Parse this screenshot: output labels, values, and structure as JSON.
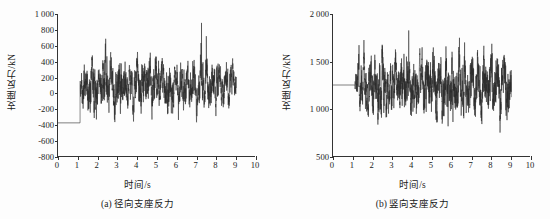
{
  "figure": {
    "background_color": "#fdfdfd",
    "trace_color": "#2b2b2b",
    "axis_color": "#333333"
  },
  "panels": [
    {
      "id": "panel-a",
      "caption": "(a) 径向支座反力",
      "xlabel": "时间/s",
      "ylabel": "支座反力/kN",
      "xticks": [
        "0",
        "1",
        "2",
        "3",
        "4",
        "5",
        "6",
        "7",
        "8",
        "9",
        "10"
      ],
      "yticks": [
        "1 000",
        "800",
        "600",
        "400",
        "200",
        "0",
        "-200",
        "-400",
        "-600",
        "-800"
      ]
    },
    {
      "id": "panel-b",
      "caption": "(b) 竖向支座反力",
      "xlabel": "时间/s",
      "ylabel": "支座反力/kN",
      "xticks": [
        "0",
        "1",
        "2",
        "3",
        "4",
        "5",
        "6",
        "7",
        "8",
        "9",
        "10"
      ],
      "yticks": [
        "2 000",
        "1 500",
        "1 000",
        "500"
      ]
    }
  ],
  "chart_data": [
    {
      "type": "line",
      "id": "panel-a",
      "title": "(a) 径向支座反力",
      "xlabel": "时间/s",
      "ylabel": "支座反力/kN",
      "xlim": [
        0,
        10
      ],
      "ylim": [
        -800,
        1000
      ],
      "xticks": [
        0,
        1,
        2,
        3,
        4,
        5,
        6,
        7,
        8,
        9,
        10
      ],
      "yticks": [
        -800,
        -600,
        -400,
        -200,
        0,
        200,
        400,
        600,
        800,
        1000
      ],
      "grid": false,
      "legend": null,
      "series": [
        {
          "name": "径向支座反力",
          "description": "Static baseline at approximately -380 kN from t=0 to t=1.12 s, then a dense high-frequency random vibration record from t=1.12 s to t=9.05 s oscillating about a mean of roughly +100 kN, with peaks reaching about 920 kN and troughs down to about -720 kN.",
          "baseline_value": -380,
          "baseline_end_time": 1.12,
          "record_start_time": 1.12,
          "record_end_time": 9.05,
          "mean_after_start": 100,
          "max_value": 920,
          "min_value": -720,
          "sample_rate_hz": 200,
          "seed": 20317,
          "envelope_points": [
            {
              "t": 1.12,
              "hi": 200,
              "lo": -300
            },
            {
              "t": 1.25,
              "hi": 660,
              "lo": -320
            },
            {
              "t": 1.55,
              "hi": 520,
              "lo": -420
            },
            {
              "t": 1.85,
              "hi": 540,
              "lo": -720
            },
            {
              "t": 2.15,
              "hi": 600,
              "lo": -450
            },
            {
              "t": 2.42,
              "hi": 920,
              "lo": -400
            },
            {
              "t": 2.7,
              "hi": 600,
              "lo": -430
            },
            {
              "t": 2.95,
              "hi": 790,
              "lo": -480
            },
            {
              "t": 3.2,
              "hi": 760,
              "lo": -520
            },
            {
              "t": 3.5,
              "hi": 560,
              "lo": -420
            },
            {
              "t": 3.8,
              "hi": 520,
              "lo": -380
            },
            {
              "t": 4.1,
              "hi": 600,
              "lo": -470
            },
            {
              "t": 4.4,
              "hi": 520,
              "lo": -560
            },
            {
              "t": 4.7,
              "hi": 650,
              "lo": -430
            },
            {
              "t": 5.0,
              "hi": 620,
              "lo": -500
            },
            {
              "t": 5.3,
              "hi": 560,
              "lo": -400
            },
            {
              "t": 5.6,
              "hi": 540,
              "lo": -620
            },
            {
              "t": 5.9,
              "hi": 540,
              "lo": -400
            },
            {
              "t": 6.2,
              "hi": 600,
              "lo": -380
            },
            {
              "t": 6.5,
              "hi": 560,
              "lo": -420
            },
            {
              "t": 6.8,
              "hi": 520,
              "lo": -350
            },
            {
              "t": 7.05,
              "hi": 740,
              "lo": -490
            },
            {
              "t": 7.35,
              "hi": 840,
              "lo": -430
            },
            {
              "t": 7.65,
              "hi": 600,
              "lo": -380
            },
            {
              "t": 7.95,
              "hi": 580,
              "lo": -520
            },
            {
              "t": 8.25,
              "hi": 560,
              "lo": -400
            },
            {
              "t": 8.55,
              "hi": 520,
              "lo": -360
            },
            {
              "t": 8.85,
              "hi": 560,
              "lo": -380
            },
            {
              "t": 9.05,
              "hi": 420,
              "lo": -250
            }
          ]
        }
      ]
    },
    {
      "type": "line",
      "id": "panel-b",
      "title": "(b) 竖向支座反力",
      "xlabel": "时间/s",
      "ylabel": "支座反力/kN",
      "xlim": [
        0,
        10
      ],
      "ylim": [
        500,
        2000
      ],
      "xticks": [
        0,
        1,
        2,
        3,
        4,
        5,
        6,
        7,
        8,
        9,
        10
      ],
      "yticks": [
        500,
        1000,
        1500,
        2000
      ],
      "grid": false,
      "legend": null,
      "series": [
        {
          "name": "竖向支座反力",
          "description": "Static baseline at approximately 1250 kN from t=0 to t=1.12 s, then a dense high-frequency random vibration record from t=1.12 s to t=9.05 s oscillating about a mean of roughly 1250 kN, with peaks reaching about 1950 kN and troughs down to about 590 kN.",
          "baseline_value": 1250,
          "baseline_end_time": 1.12,
          "record_start_time": 1.12,
          "record_end_time": 9.05,
          "mean_after_start": 1250,
          "max_value": 1950,
          "min_value": 590,
          "sample_rate_hz": 220,
          "seed": 77431,
          "envelope_points": [
            {
              "t": 1.12,
              "hi": 1420,
              "lo": 1080
            },
            {
              "t": 1.3,
              "hi": 1850,
              "lo": 830
            },
            {
              "t": 1.6,
              "hi": 1680,
              "lo": 760
            },
            {
              "t": 1.9,
              "hi": 1700,
              "lo": 700
            },
            {
              "t": 2.15,
              "hi": 1680,
              "lo": 720
            },
            {
              "t": 2.42,
              "hi": 1950,
              "lo": 690
            },
            {
              "t": 2.7,
              "hi": 1700,
              "lo": 700
            },
            {
              "t": 3.0,
              "hi": 1720,
              "lo": 760
            },
            {
              "t": 3.3,
              "hi": 1660,
              "lo": 780
            },
            {
              "t": 3.6,
              "hi": 1800,
              "lo": 610
            },
            {
              "t": 3.9,
              "hi": 1690,
              "lo": 720
            },
            {
              "t": 4.2,
              "hi": 1750,
              "lo": 740
            },
            {
              "t": 4.5,
              "hi": 1700,
              "lo": 690
            },
            {
              "t": 4.8,
              "hi": 1820,
              "lo": 660
            },
            {
              "t": 5.05,
              "hi": 1900,
              "lo": 700
            },
            {
              "t": 5.35,
              "hi": 1700,
              "lo": 680
            },
            {
              "t": 5.65,
              "hi": 1720,
              "lo": 590
            },
            {
              "t": 5.95,
              "hi": 1780,
              "lo": 700
            },
            {
              "t": 6.25,
              "hi": 1900,
              "lo": 720
            },
            {
              "t": 6.55,
              "hi": 1760,
              "lo": 690
            },
            {
              "t": 6.85,
              "hi": 1700,
              "lo": 740
            },
            {
              "t": 7.15,
              "hi": 1720,
              "lo": 720
            },
            {
              "t": 7.45,
              "hi": 1780,
              "lo": 640
            },
            {
              "t": 7.75,
              "hi": 1700,
              "lo": 700
            },
            {
              "t": 8.05,
              "hi": 1760,
              "lo": 680
            },
            {
              "t": 8.35,
              "hi": 1850,
              "lo": 700
            },
            {
              "t": 8.65,
              "hi": 1720,
              "lo": 720
            },
            {
              "t": 8.9,
              "hi": 1700,
              "lo": 660
            },
            {
              "t": 9.05,
              "hi": 1620,
              "lo": 900
            }
          ]
        }
      ]
    }
  ]
}
